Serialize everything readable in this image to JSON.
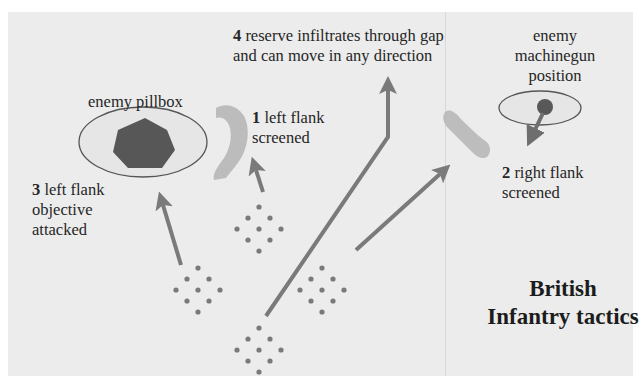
{
  "diagram": {
    "title_line1": "British",
    "title_line2": "Infantry tactics",
    "labels": {
      "pillbox": "enemy pillbox",
      "machinegun_line1": "enemy",
      "machinegun_line2": "machinegun",
      "machinegun_line3": "position",
      "step1_num": "1",
      "step1_line1": " left flank",
      "step1_line2": "screened",
      "step2_num": "2",
      "step2_line1": " right flank",
      "step2_line2": "screened",
      "step3_num": "3",
      "step3_line1": " left flank",
      "step3_line2": "objective",
      "step3_line3": "attacked",
      "step4_num": "4",
      "step4_line1": " reserve infiltrates through gap",
      "step4_line2": "and can move in any direction"
    },
    "colors": {
      "background": "#ececec",
      "arrow": "#7a7a7a",
      "dot": "#7a7a7a",
      "pillbox": "#555555",
      "ellipse_fill": "#e4e4e4",
      "ellipse_stroke": "#555555",
      "smoke": "#bdbdbd"
    },
    "formations": [
      {
        "name": "left-flank-attack-section",
        "cx": 198,
        "cy": 290
      },
      {
        "name": "left-flank-screen-section",
        "cx": 259,
        "cy": 222
      },
      {
        "name": "right-flank-screen-section",
        "cx": 322,
        "cy": 290
      },
      {
        "name": "reserve-section",
        "cx": 259,
        "cy": 350
      }
    ]
  }
}
